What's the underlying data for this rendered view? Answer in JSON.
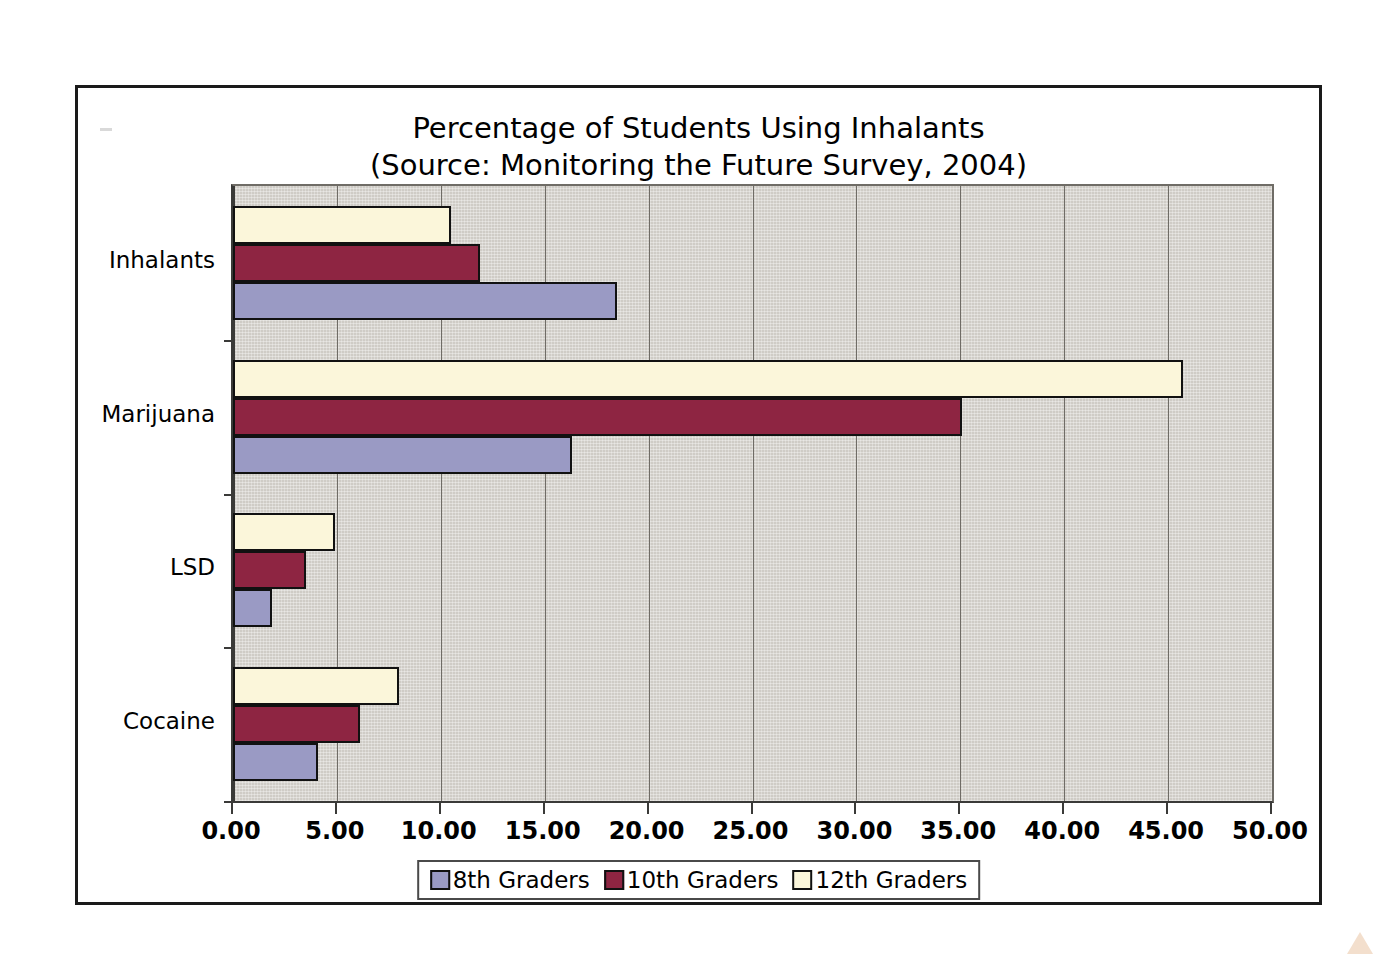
{
  "chart_data": {
    "type": "bar",
    "orientation": "horizontal",
    "title": "Percentage of Students Using Inhalants",
    "subtitle": "(Source: Monitoring the Future Survey, 2004)",
    "xlabel": "",
    "ylabel": "",
    "categories": [
      "Inhalants",
      "Marijuana",
      "LSD",
      "Cocaine"
    ],
    "series": [
      {
        "name": "8th Graders",
        "color": "#9a9ac4",
        "values": [
          18.5,
          16.3,
          1.9,
          4.1
        ]
      },
      {
        "name": "10th Graders",
        "color": "#8e2542",
        "values": [
          11.9,
          35.1,
          3.5,
          6.1
        ]
      },
      {
        "name": "12th Graders",
        "color": "#fbf6da",
        "values": [
          10.5,
          45.7,
          4.9,
          8.0
        ]
      }
    ],
    "xlim": [
      0,
      50
    ],
    "xticks": [
      0,
      5,
      10,
      15,
      20,
      25,
      30,
      35,
      40,
      45,
      50
    ],
    "xtick_labels": [
      "0.00",
      "5.00",
      "10.00",
      "15.00",
      "20.00",
      "25.00",
      "30.00",
      "35.00",
      "40.00",
      "45.00",
      "50.00"
    ],
    "grid": true,
    "grid_axis": "x",
    "legend_position": "bottom",
    "plot_background": "#cfccc6",
    "frame_color": "#1a1a1a"
  },
  "legend": {
    "items": [
      {
        "label": "8th Graders"
      },
      {
        "label": "10th Graders"
      },
      {
        "label": "12th Graders"
      }
    ]
  }
}
